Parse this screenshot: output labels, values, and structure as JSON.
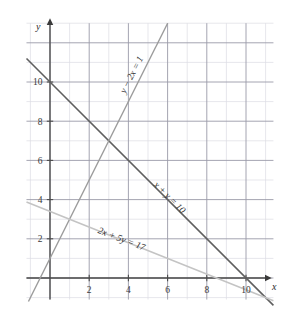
{
  "figure": {
    "background_color": "#ffffff"
  },
  "axes": {
    "x_axis_name": "x",
    "y_axis_name": "y",
    "x_ticks": [
      "2",
      "4",
      "6",
      "8",
      "10"
    ],
    "y_ticks": [
      "2",
      "4",
      "6",
      "8",
      "10"
    ],
    "axis_color": "#4a4a4a",
    "major_grid_color": "#9a9aa8",
    "minor_grid_color": "#d8d8e0"
  },
  "labels": {
    "line1": "y − 2x = 1",
    "line2": "x + y = 10",
    "line3": "2x + 5y = 17"
  },
  "chart_data": {
    "type": "line",
    "xlabel": "x",
    "ylabel": "y",
    "xlim": [
      -1.2,
      11.4
    ],
    "ylim": [
      -1.1,
      13.0
    ],
    "grid": true,
    "major_grid_step": 2,
    "minor_grid_step": 1,
    "legend": "inline-rotated-labels",
    "xticks": [
      2,
      4,
      6,
      8,
      10
    ],
    "yticks": [
      2,
      4,
      6,
      8,
      10
    ],
    "series": [
      {
        "name": "x + y = 10",
        "equation": "x + y = 10",
        "slope": -1,
        "intercept": 10,
        "color": "#5f5f5f",
        "width": 1.6,
        "points": [
          [
            -1.2,
            11.2
          ],
          [
            11.4,
            -1.4
          ]
        ],
        "x_intercept": 10,
        "y_intercept": 10,
        "label": "x + y = 10",
        "label_at": [
          6.0,
          4.0
        ],
        "label_rotation": 45
      },
      {
        "name": "y - 2x = 1",
        "equation": "y − 2x = 1",
        "slope": 2,
        "intercept": 1,
        "color": "#9b9b9b",
        "width": 1.4,
        "points": [
          [
            -1.1,
            -1.2
          ],
          [
            6.0,
            13.0
          ]
        ],
        "x_intercept": -0.5,
        "y_intercept": 1,
        "label": "y − 2x = 1",
        "label_at": [
          4.3,
          10.3
        ],
        "label_rotation": -63
      },
      {
        "name": "2x + 5y = 17",
        "equation": "2x + 5y = 17",
        "slope": -0.4,
        "intercept": 3.4,
        "color": "#c4c4c4",
        "width": 1.5,
        "points": [
          [
            -1.2,
            3.88
          ],
          [
            11.4,
            -1.16
          ]
        ],
        "x_intercept": 8.5,
        "y_intercept": 3.4,
        "label": "2x + 5y = 17",
        "label_at": [
          3.6,
          1.85
        ],
        "label_rotation": 21
      }
    ],
    "intersections": [
      {
        "lines": [
          "x + y = 10",
          "y - 2x = 1"
        ],
        "point": [
          3,
          7
        ]
      },
      {
        "lines": [
          "y - 2x = 1",
          "2x + 5y = 17"
        ],
        "point": [
          1,
          3
        ]
      }
    ]
  }
}
